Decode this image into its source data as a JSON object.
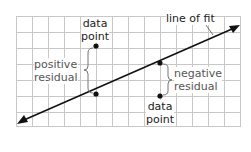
{
  "diagram": {
    "type": "scatter plot with line of fit and residuals",
    "colors": {
      "grid": "#c8c8c8",
      "line": "#111111",
      "point": "#111111",
      "brace": "#777777",
      "text": "#222222",
      "residual_text": "#555555"
    },
    "labels": {
      "line_of_fit": "line of fit",
      "data_point_top": [
        "data",
        "point"
      ],
      "data_point_bottom": [
        "data",
        "point"
      ],
      "positive_residual": [
        "positive",
        "residual"
      ],
      "negative_residual": [
        "negative",
        "residual"
      ]
    },
    "points": [
      {
        "name": "data point above line",
        "x": 96,
        "y": 46
      },
      {
        "name": "line point (positive residual)",
        "x": 96,
        "y": 94
      },
      {
        "name": "line point (negative residual)",
        "x": 160,
        "y": 63
      },
      {
        "name": "data point below line",
        "x": 160,
        "y": 96
      }
    ]
  }
}
